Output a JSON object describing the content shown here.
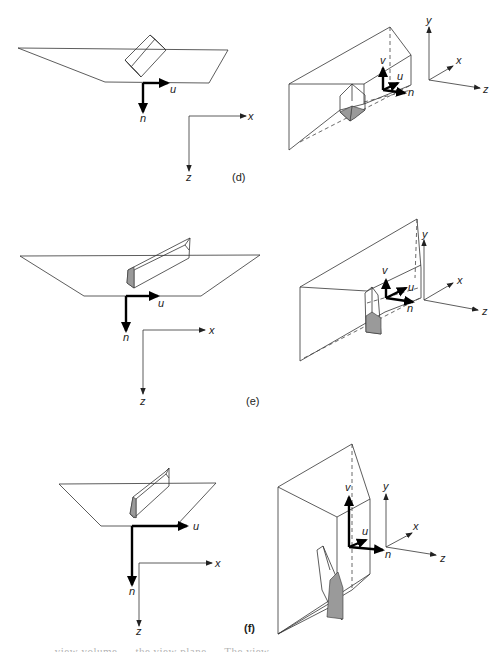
{
  "figure": {
    "panels": [
      {
        "id": "d",
        "caption": "(d)",
        "view_plane_labels": {
          "u": "u",
          "n": "n"
        },
        "world_axes_2d": {
          "x": "x",
          "z": "z"
        },
        "view_volume_labels": {
          "v": "v",
          "u": "u",
          "n": "n"
        },
        "world_axes_3d": {
          "x": "x",
          "y": "y",
          "z": "z"
        }
      },
      {
        "id": "e",
        "caption": "(e)",
        "view_plane_labels": {
          "u": "u",
          "n": "n"
        },
        "world_axes_2d": {
          "x": "x",
          "z": "z"
        },
        "view_volume_labels": {
          "v": "v",
          "u": "u",
          "n": "n"
        },
        "world_axes_3d": {
          "x": "x",
          "y": "y",
          "z": "z"
        }
      },
      {
        "id": "f",
        "caption": "(f)",
        "view_plane_labels": {
          "u": "u",
          "n": "n"
        },
        "world_axes_2d": {
          "x": "x",
          "z": "z"
        },
        "view_volume_labels": {
          "v": "v",
          "u": "u",
          "n": "n"
        },
        "world_axes_3d": {
          "x": "x",
          "y": "y",
          "z": "z"
        }
      }
    ],
    "footer_text": "… view volume … the view plane … The view …",
    "colors": {
      "line": "#333333",
      "shade": "#9a9a9a",
      "background": "#ffffff"
    }
  }
}
